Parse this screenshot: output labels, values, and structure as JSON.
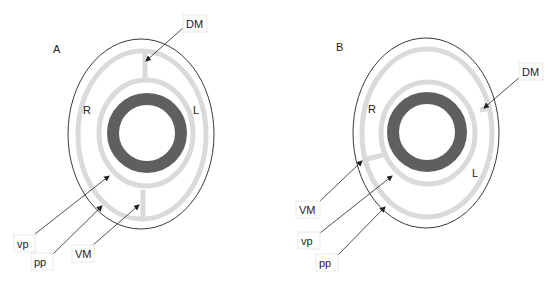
{
  "figure": {
    "panels": [
      {
        "id": "A",
        "panel_label": "A",
        "side_labels": {
          "right": "R",
          "left": "L"
        },
        "callouts": {
          "dm": "DM",
          "vp": "vp",
          "pp": "pp",
          "vm": "VM"
        }
      },
      {
        "id": "B",
        "panel_label": "B",
        "side_labels": {
          "right": "R",
          "left": "L"
        },
        "callouts": {
          "dm": "DM",
          "vm": "VM",
          "vp": "vp",
          "pp": "pp"
        }
      }
    ],
    "colors": {
      "outline": "#222222",
      "band": "#d9d9d9",
      "ring": "#5f5f5f",
      "label_box_border": "#e6e6e6"
    }
  }
}
